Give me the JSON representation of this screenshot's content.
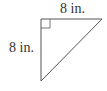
{
  "diagram": {
    "shape": "right-triangle",
    "labels": {
      "top": "8 in.",
      "left": "8 in."
    },
    "stroke_color": "#555555",
    "right_angle_marker": true
  }
}
